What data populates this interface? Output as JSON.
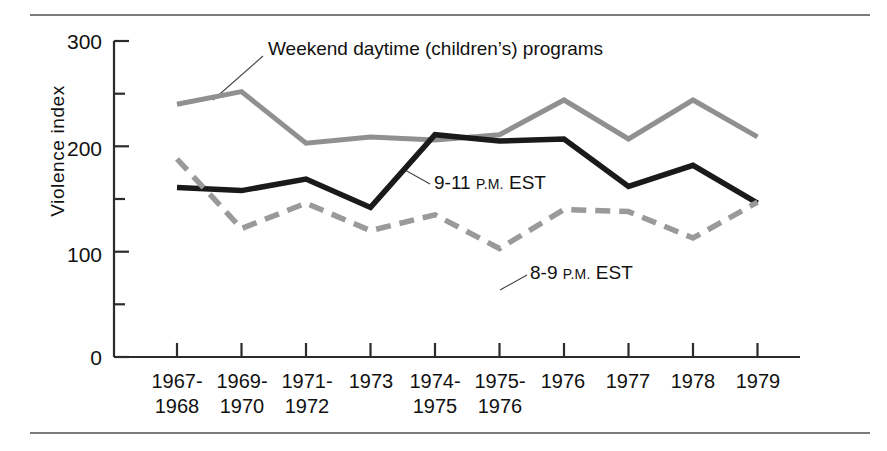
{
  "figure": {
    "y_axis_title": "Violence index",
    "annotations": {
      "weekend": "Weekend daytime (children’s) programs",
      "late": {
        "main": "9-11 ",
        "small": "P.M.",
        "tail": " EST"
      },
      "early": {
        "main": "8-9 ",
        "small": "P.M.",
        "tail": " EST"
      }
    }
  },
  "chart_data": {
    "type": "line",
    "title": "",
    "xlabel": "",
    "ylabel": "Violence index",
    "ylim": [
      0,
      300
    ],
    "yticks": [
      0,
      50,
      100,
      150,
      200,
      250,
      300
    ],
    "ytick_labels_major": [
      "0",
      "100",
      "200",
      "300"
    ],
    "ytick_major": [
      0,
      100,
      200,
      300
    ],
    "ytick_minor": [
      50,
      150,
      250
    ],
    "grid": false,
    "legend": "inline-annotations",
    "categories": [
      "1967-1968",
      "1969-1970",
      "1971-1972",
      "1973",
      "1974-1975",
      "1975-1976",
      "1976",
      "1977",
      "1978",
      "1979"
    ],
    "category_lines": [
      [
        "1967-",
        "1968"
      ],
      [
        "1969-",
        "1970"
      ],
      [
        "1971-",
        "1972"
      ],
      [
        "1973",
        ""
      ],
      [
        "1974-",
        "1975"
      ],
      [
        "1975-",
        "1976"
      ],
      [
        "1976",
        ""
      ],
      [
        "1977",
        ""
      ],
      [
        "1978",
        ""
      ],
      [
        "1979",
        ""
      ]
    ],
    "series": [
      {
        "name": "Weekend daytime (children’s) programs",
        "style": "solid",
        "color": "#909090",
        "values": [
          240,
          252,
          203,
          209,
          206,
          211,
          244,
          207,
          244,
          209
        ]
      },
      {
        "name": "9-11 P.M. EST",
        "style": "solid",
        "color": "#1a1a1a",
        "values": [
          161,
          158,
          169,
          142,
          211,
          205,
          207,
          162,
          182,
          146
        ]
      },
      {
        "name": "8-9 P.M. EST",
        "style": "dashed",
        "color": "#9a9a9a",
        "values": [
          188,
          122,
          146,
          120,
          135,
          103,
          140,
          138,
          113,
          147
        ]
      }
    ]
  }
}
